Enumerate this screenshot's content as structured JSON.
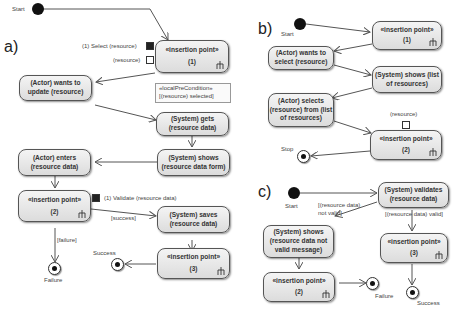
{
  "panels": {
    "a": {
      "label": "a)",
      "start_label": "Start",
      "pins": {
        "select": "(1) Select (resource)",
        "resource": "(resource)",
        "validate": "(1) Validate (resource data)"
      },
      "note": {
        "stereotype": "«localPreCondition»",
        "text": "[(resource) selected]"
      },
      "nodes": {
        "ip1": {
          "title": "«insertion point»",
          "num": "(1)"
        },
        "wants_update": "(Actor) wants to update (resource)",
        "gets": "(System) gets (resource data)",
        "shows_form": "(System) shows (resource data form)",
        "enters": "(Actor) enters (resource data)",
        "ip2": {
          "title": "«insertion point»",
          "num": "(2)"
        },
        "saves": "(System) saves (resource data)",
        "ip3": {
          "title": "«insertion point»",
          "num": "(3)"
        }
      },
      "guards": {
        "success": "[success]",
        "failure": "[failure]"
      },
      "finals": {
        "success": "Success",
        "failure": "Failure"
      }
    },
    "b": {
      "label": "b)",
      "start_label": "Start",
      "pin_label": "(resource)",
      "nodes": {
        "ip1": {
          "title": "«insertion point»",
          "num": "(1)"
        },
        "wants_select": "(Actor) wants to select (resource)",
        "shows_list": "(System) shows (list of resources)",
        "selects": "(Actor) selects (resource) from (list of resources)",
        "ip2": {
          "title": "«insertion point»",
          "num": "(2)"
        }
      },
      "final_label": "Stop"
    },
    "c": {
      "label": "c)",
      "start_label": "Start",
      "nodes": {
        "validates": "(System) validates (resource data)",
        "shows_invalid": "(System) shows (resource data not valid message)",
        "ip3": {
          "title": "«insertion point»",
          "num": "(3)"
        },
        "ip2": {
          "title": "«insertion point»",
          "num": "(2)"
        }
      },
      "guards": {
        "not_valid": "[(resource data) not valid]",
        "valid": "[(resource data) valid]"
      },
      "finals": {
        "failure": "Failure",
        "success": "Success"
      }
    }
  }
}
